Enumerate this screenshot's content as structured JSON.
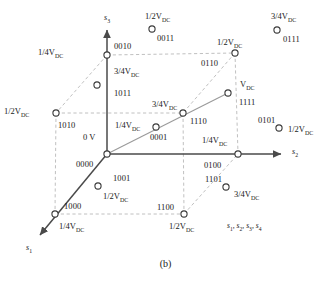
{
  "figure": {
    "caption": "(b)",
    "legend": "s₁, s₂, s₃, s₄",
    "axes": [
      {
        "name": "s3",
        "label": "s",
        "sub": "3",
        "x": 104,
        "y": 14
      },
      {
        "name": "s2",
        "label": "s",
        "sub": "2",
        "x": 292,
        "y": 148
      },
      {
        "name": "s1",
        "label": "s",
        "sub": "1",
        "x": 26,
        "y": 244
      }
    ],
    "origin_label": {
      "voltage": "0 V",
      "code": "0000"
    }
  },
  "nodes": [
    {
      "id": "0000",
      "code": "0000",
      "voltage": "0 V",
      "cx": 107,
      "cy": 154,
      "on_cube": true,
      "volt_x": 83,
      "volt_y": 133,
      "code_x": 76,
      "code_y": 160
    },
    {
      "id": "0010",
      "code": "0010",
      "voltage": "1/4V",
      "sub": "DC",
      "cx": 107,
      "cy": 55,
      "on_cube": true,
      "volt_x": 38,
      "volt_y": 48,
      "code_x": 114,
      "code_y": 42
    },
    {
      "id": "1010",
      "code": "1010",
      "voltage": "1/2V",
      "sub": "DC",
      "cx": 56,
      "cy": 113,
      "on_cube": true,
      "volt_x": 4,
      "volt_y": 107,
      "code_x": 58,
      "code_y": 121
    },
    {
      "id": "0110",
      "code": "0110",
      "voltage": "1/2V",
      "sub": "DC",
      "cx": 235,
      "cy": 53,
      "on_cube": true,
      "volt_x": 217,
      "volt_y": 38,
      "code_x": 201,
      "code_y": 59
    },
    {
      "id": "1110",
      "code": "1110",
      "voltage": "3/4V",
      "sub": "DC",
      "cx": 183,
      "cy": 113,
      "on_cube": true,
      "volt_x": 152,
      "volt_y": 100,
      "code_x": 190,
      "code_y": 117
    },
    {
      "id": "1111",
      "code": "1111",
      "voltage": "V",
      "sub": "DC",
      "cx": 228,
      "cy": 93,
      "on_cube": true,
      "volt_x": 240,
      "volt_y": 80,
      "code_x": 239,
      "code_y": 98
    },
    {
      "id": "0100",
      "code": "0100",
      "voltage": "1/4V",
      "sub": "DC",
      "cx": 238,
      "cy": 154,
      "on_cube": true,
      "volt_x": 202,
      "volt_y": 136,
      "code_x": 204,
      "code_y": 161
    },
    {
      "id": "1100",
      "code": "1100",
      "voltage": "1/2V",
      "sub": "DC",
      "cx": 184,
      "cy": 214,
      "on_cube": true,
      "volt_x": 169,
      "volt_y": 222,
      "code_x": 157,
      "code_y": 203
    },
    {
      "id": "1000",
      "code": "1000",
      "voltage": "1/4V",
      "sub": "DC",
      "cx": 55,
      "cy": 214,
      "on_cube": true,
      "volt_x": 59,
      "volt_y": 222,
      "code_x": 64,
      "code_y": 202
    },
    {
      "id": "0011",
      "code": "0011",
      "voltage": "1/2V",
      "sub": "DC",
      "cx": 152,
      "cy": 29,
      "on_cube": false,
      "volt_x": 145,
      "volt_y": 12,
      "code_x": 157,
      "code_y": 34
    },
    {
      "id": "0111",
      "code": "0111",
      "voltage": "3/4V",
      "sub": "DC",
      "cx": 277,
      "cy": 30,
      "on_cube": false,
      "volt_x": 271,
      "volt_y": 12,
      "code_x": 283,
      "code_y": 35
    },
    {
      "id": "0101",
      "code": "0101",
      "voltage": "1/2V",
      "sub": "DC",
      "cx": 279,
      "cy": 128,
      "on_cube": false,
      "volt_x": 288,
      "volt_y": 125,
      "code_x": 258,
      "code_y": 116
    },
    {
      "id": "1101",
      "code": "1101",
      "voltage": "3/4V",
      "sub": "DC",
      "cx": 226,
      "cy": 187,
      "on_cube": false,
      "volt_x": 234,
      "volt_y": 190,
      "code_x": 205,
      "code_y": 175
    },
    {
      "id": "1001",
      "code": "1001",
      "voltage": "1/2V",
      "sub": "DC",
      "cx": 98,
      "cy": 186,
      "on_cube": false,
      "volt_x": 103,
      "volt_y": 192,
      "code_x": 113,
      "code_y": 174
    },
    {
      "id": "1011",
      "code": "1011",
      "voltage": "3/4V",
      "sub": "DC",
      "cx": 97,
      "cy": 85,
      "on_cube": false,
      "volt_x": 114,
      "volt_y": 67,
      "code_x": 114,
      "code_y": 89
    },
    {
      "id": "0001",
      "code": "0001",
      "voltage": "1/4V",
      "sub": "DC",
      "cx": 156,
      "cy": 127,
      "on_cube": false,
      "volt_x": 115,
      "volt_y": 121,
      "code_x": 150,
      "code_y": 133
    }
  ],
  "colors": {
    "axis": "#4a4a4a",
    "dashed": "#b9b9b9",
    "diagonal": "#9a9a9a",
    "node_stroke": "#3a3a3a",
    "text": "#1a1a1a"
  }
}
